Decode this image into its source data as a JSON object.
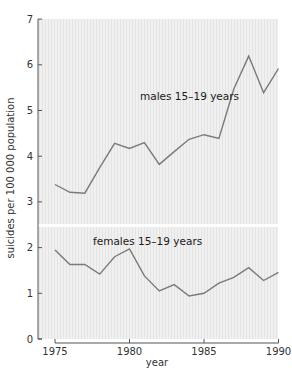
{
  "chart_data": {
    "type": "line",
    "title": "",
    "xlabel": "year",
    "ylabel": "suicides per 100 000 population",
    "xlim": [
      1974.8,
      1990
    ],
    "ylim": [
      0,
      7
    ],
    "x_ticks": [
      1975,
      1980,
      1985,
      1990
    ],
    "y_ticks": [
      0,
      1,
      2,
      3,
      4,
      5,
      6,
      7
    ],
    "grid": false,
    "legend": "inline labels",
    "axis_break": {
      "between": [
        2,
        3
      ],
      "note": "white horizontal gap across plot area"
    },
    "x": [
      1975,
      1976,
      1977,
      1978,
      1979,
      1980,
      1981,
      1982,
      1983,
      1984,
      1985,
      1986,
      1987,
      1988,
      1989,
      1990
    ],
    "series": [
      {
        "name": "males 15–19 years",
        "color": "#7a7a7a",
        "values": [
          3.38,
          3.21,
          3.19,
          3.75,
          4.28,
          4.17,
          4.3,
          3.82,
          4.1,
          4.37,
          4.47,
          4.39,
          5.47,
          6.19,
          5.39,
          5.92
        ]
      },
      {
        "name": "females 15–19 years",
        "color": "#7a7a7a",
        "values": [
          1.95,
          1.63,
          1.63,
          1.42,
          1.8,
          1.97,
          1.38,
          1.05,
          1.19,
          0.94,
          1.0,
          1.22,
          1.35,
          1.56,
          1.28,
          1.46
        ]
      }
    ]
  },
  "labels": {
    "males": "males 15–19 years",
    "females": "females 15–19 years",
    "xlabel": "year",
    "ylabel": "suicides per 100 000 population"
  },
  "colors": {
    "plot_bg": "#eeeeee",
    "axis": "#555555",
    "line": "#7a7a7a"
  }
}
